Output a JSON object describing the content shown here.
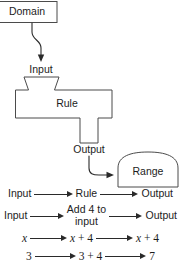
{
  "figure": {
    "line_color": "#4b4b4b",
    "arrow_color": "#2a2a2a",
    "text_color": "#1c1c1c",
    "background": "#ffffff"
  },
  "diagram": {
    "domain_box_label": "Domain",
    "input_label": "Input",
    "rule_label": "Rule",
    "output_label": "Output",
    "range_label": "Range"
  },
  "rows": [
    {
      "id": "row-generic",
      "left": "Input",
      "middle": "Rule",
      "right": "Output"
    },
    {
      "id": "row-words",
      "left": "Input",
      "middle_line1": "Add 4 to",
      "middle_line2": "input",
      "right": "Output"
    },
    {
      "id": "row-variable",
      "left": "x",
      "middle_var": "x",
      "middle_rest": " + 4",
      "right_var": "x",
      "right_rest": " + 4"
    },
    {
      "id": "row-numeric",
      "left": "3",
      "middle": "3 + 4",
      "right": "7"
    }
  ]
}
